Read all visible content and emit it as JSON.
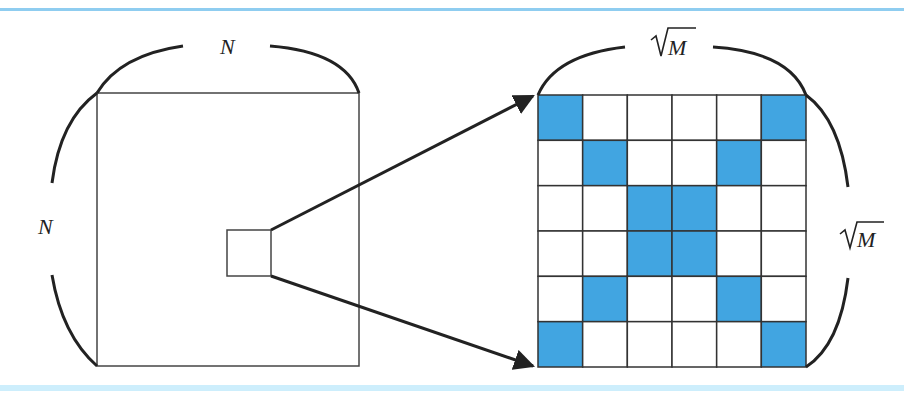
{
  "labels": {
    "left_top": "N",
    "left_side": "N",
    "right_top": "M",
    "right_side": "M"
  },
  "colors": {
    "accent": "#41a5e1",
    "rule": "#8fcdf0",
    "stroke": "#222222"
  },
  "grid": {
    "size": 6,
    "highlighted_cells": [
      [
        0,
        0
      ],
      [
        0,
        5
      ],
      [
        1,
        1
      ],
      [
        1,
        4
      ],
      [
        2,
        2
      ],
      [
        2,
        3
      ],
      [
        3,
        2
      ],
      [
        3,
        3
      ],
      [
        4,
        1
      ],
      [
        4,
        4
      ],
      [
        5,
        0
      ],
      [
        5,
        5
      ]
    ]
  }
}
